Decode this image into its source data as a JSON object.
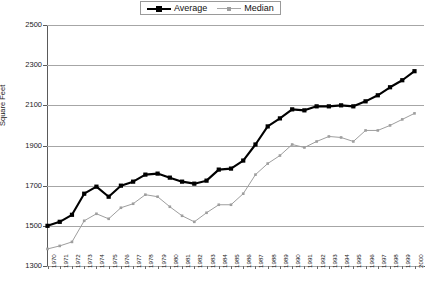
{
  "legend": {
    "position": "top-center",
    "entries": [
      {
        "label": "Average",
        "color": "#000000",
        "marker": "square"
      },
      {
        "label": "Median",
        "color": "#9e9e9e",
        "marker": "small-square"
      }
    ]
  },
  "axes": {
    "ylabel": "Square Feet",
    "xlabel": "",
    "yticks": [
      1300,
      1500,
      1700,
      1900,
      2100,
      2300,
      2500
    ],
    "ylim": [
      1300,
      2500
    ],
    "grid": true
  },
  "chart_data": {
    "type": "line",
    "title": "",
    "xlabel": "",
    "ylabel": "Square Feet",
    "ylim": [
      1300,
      2500
    ],
    "grid": true,
    "legend_position": "top-center",
    "categories": [
      "1970",
      "1971",
      "1972",
      "1973",
      "1974",
      "1975",
      "1976",
      "1977",
      "1978",
      "1979",
      "1980",
      "1981",
      "1982",
      "1983",
      "1984",
      "1985",
      "1986",
      "1987",
      "1988",
      "1989",
      "1990",
      "1991",
      "1992",
      "1993",
      "1994",
      "1995",
      "1996",
      "1997",
      "1998",
      "1999",
      "2000"
    ],
    "series": [
      {
        "name": "Average",
        "color": "#000000",
        "marker": "square",
        "values": [
          1500,
          1520,
          1555,
          1660,
          1695,
          1645,
          1700,
          1720,
          1755,
          1760,
          1740,
          1720,
          1710,
          1725,
          1780,
          1785,
          1825,
          1905,
          1995,
          2035,
          2080,
          2075,
          2095,
          2095,
          2100,
          2095,
          2120,
          2150,
          2190,
          2225,
          2270
        ]
      },
      {
        "name": "Median",
        "color": "#9e9e9e",
        "marker": "small-square",
        "values": [
          1385,
          1400,
          1420,
          1525,
          1560,
          1535,
          1590,
          1610,
          1655,
          1645,
          1595,
          1550,
          1520,
          1565,
          1605,
          1605,
          1660,
          1755,
          1810,
          1850,
          1905,
          1890,
          1920,
          1945,
          1940,
          1920,
          1975,
          1975,
          2000,
          2030,
          2060
        ]
      }
    ]
  }
}
